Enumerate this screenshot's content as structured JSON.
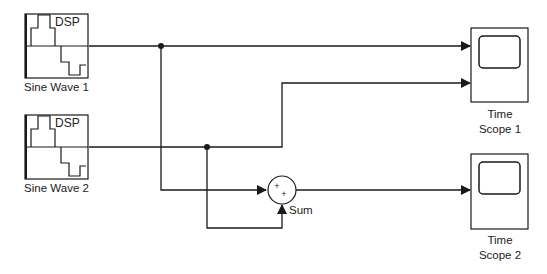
{
  "diagram": {
    "blocks": [
      {
        "id": "sine1",
        "label": "Sine Wave 1",
        "icon_text": "DSP",
        "type": "source"
      },
      {
        "id": "sine2",
        "label": "Sine Wave 2",
        "icon_text": "DSP",
        "type": "source"
      },
      {
        "id": "sum",
        "label": "Sum",
        "signs": "++",
        "type": "sum"
      },
      {
        "id": "scope1",
        "label_line1": "Time",
        "label_line2": "Scope 1",
        "type": "sink"
      },
      {
        "id": "scope2",
        "label_line1": "Time",
        "label_line2": "Scope 2",
        "type": "sink"
      }
    ],
    "connections": [
      {
        "from": "Sine Wave 1",
        "to": "Time Scope 1 (input 1)"
      },
      {
        "from": "Sine Wave 2",
        "to": "Time Scope 1 (input 2)"
      },
      {
        "from": "Sine Wave 1",
        "to": "Sum (input 1)"
      },
      {
        "from": "Sine Wave 2",
        "to": "Sum (input 2)"
      },
      {
        "from": "Sum",
        "to": "Time Scope 2"
      }
    ],
    "colors": {
      "line": "#1a1a1a",
      "background": "#ffffff"
    }
  }
}
